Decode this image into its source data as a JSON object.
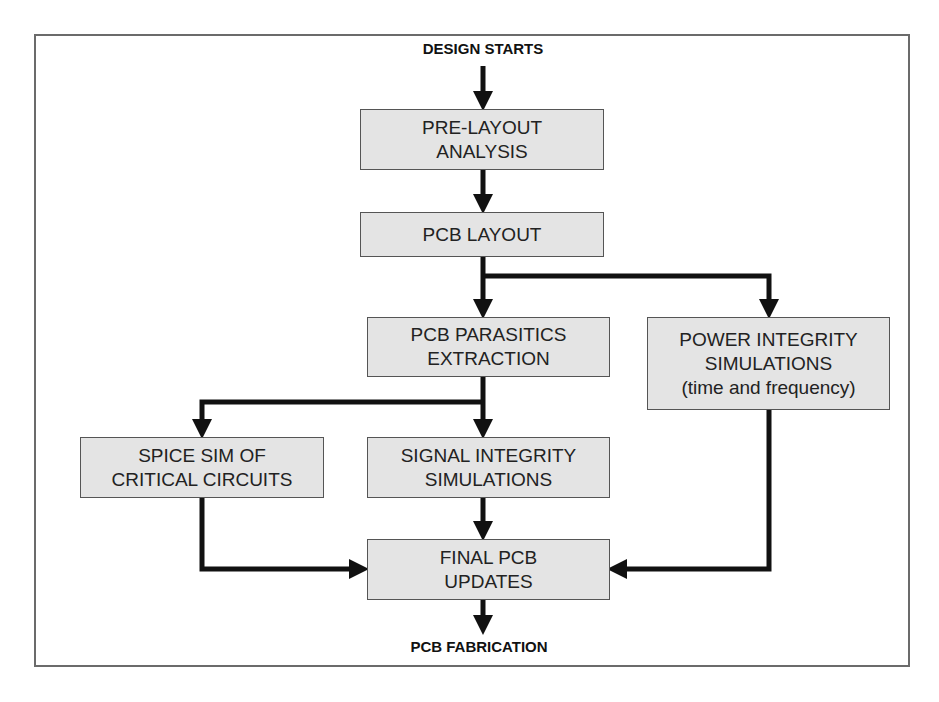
{
  "diagram": {
    "type": "flowchart",
    "start": "DESIGN STARTS",
    "end": "PCB FABRICATION",
    "nodes": {
      "pre_layout": {
        "lines": [
          "PRE-LAYOUT",
          "ANALYSIS"
        ]
      },
      "pcb_layout": {
        "lines": [
          "PCB LAYOUT"
        ]
      },
      "parasitics": {
        "lines": [
          "PCB PARASITICS",
          "EXTRACTION"
        ]
      },
      "power": {
        "lines": [
          "POWER INTEGRITY",
          "SIMULATIONS",
          "(time and frequency)"
        ]
      },
      "spice": {
        "lines": [
          "SPICE SIM OF",
          "CRITICAL CIRCUITS"
        ]
      },
      "signal": {
        "lines": [
          "SIGNAL INTEGRITY",
          "SIMULATIONS"
        ]
      },
      "final": {
        "lines": [
          "FINAL PCB",
          "UPDATES"
        ]
      }
    },
    "edges": [
      [
        "DESIGN STARTS",
        "pre_layout"
      ],
      [
        "pre_layout",
        "pcb_layout"
      ],
      [
        "pcb_layout",
        "parasitics"
      ],
      [
        "pcb_layout",
        "power"
      ],
      [
        "parasitics",
        "spice"
      ],
      [
        "parasitics",
        "signal"
      ],
      [
        "signal",
        "final"
      ],
      [
        "spice",
        "final"
      ],
      [
        "power",
        "final"
      ],
      [
        "final",
        "PCB FABRICATION"
      ]
    ],
    "colors": {
      "box_fill": "#e4e4e4",
      "box_border": "#555555",
      "arrow": "#111111",
      "frame": "#6b6b6b"
    }
  }
}
